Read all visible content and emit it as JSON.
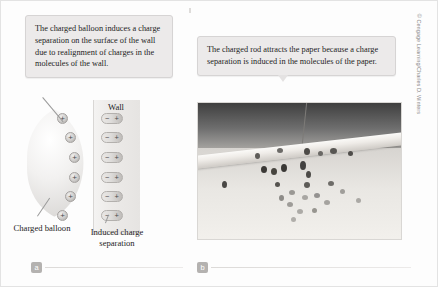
{
  "panel_a": {
    "tag": "a",
    "callout": "The charged balloon induces a charge separation on the surface of the wall due to realignment of charges in the molecules of the wall.",
    "wall_label": "Wall",
    "balloon_label": "Charged balloon",
    "induced_label": "Induced charge separation",
    "balloon_charges": [
      "+",
      "+",
      "+",
      "+",
      "+",
      "+"
    ],
    "wall_dipoles": [
      {
        "left": "−",
        "right": "+"
      },
      {
        "left": "−",
        "right": "+"
      },
      {
        "left": "−",
        "right": "+"
      },
      {
        "left": "−",
        "right": "+"
      },
      {
        "left": "−",
        "right": "+"
      },
      {
        "left": "−",
        "right": "+"
      }
    ]
  },
  "panel_b": {
    "tag": "b",
    "callout": "The charged rod attracts the paper because a charge separation is induced in the molecules of the paper.",
    "credit": "© Cengage Learning/Charles D. Winters",
    "photo_alt": "A charged rod suspended by a thread with small bits of paper clinging to it"
  },
  "colors": {
    "callout_bg": "#eceaea",
    "callout_border": "#d6d4d4",
    "tag_bg": "#b4b2b0",
    "text": "#1d1d1d",
    "credit": "#8a8a8a"
  }
}
